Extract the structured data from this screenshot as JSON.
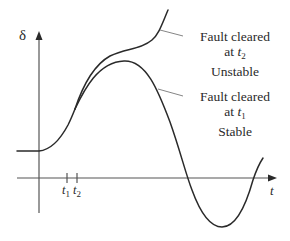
{
  "figure": {
    "title": "",
    "y_axis": {
      "symbol": "δ"
    },
    "x_axis": {
      "symbol": "t"
    },
    "ticks": [
      {
        "base": "t",
        "sub": "1"
      },
      {
        "base": "t",
        "sub": "2"
      }
    ],
    "curves": [
      {
        "id": "unstable",
        "annotation": {
          "line1": "Fault cleared",
          "line2_prefix": "at ",
          "line2_var": "t",
          "line2_sub": "2",
          "line3": "Unstable"
        }
      },
      {
        "id": "stable",
        "annotation": {
          "line1": "Fault cleared",
          "line2_prefix": "at ",
          "line2_var": "t",
          "line2_sub": "1",
          "line3": "Stable"
        }
      }
    ],
    "colors": {
      "line": "#2a2a2a",
      "axis": "#555555",
      "background": "#ffffff"
    }
  }
}
